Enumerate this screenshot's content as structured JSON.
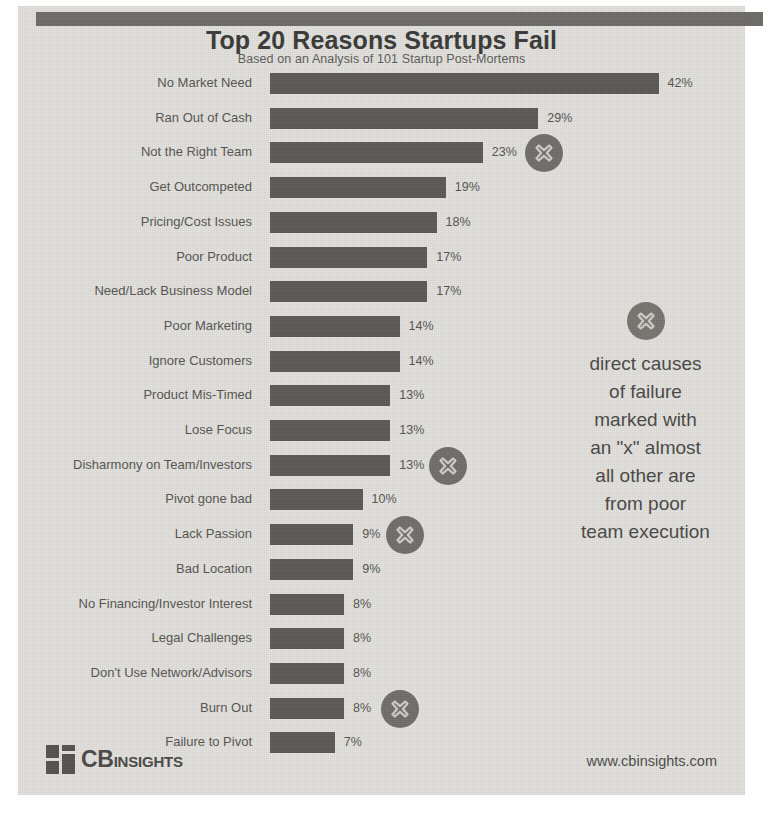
{
  "header": {
    "title": "Top 20 Reasons Startups Fail",
    "subtitle": "Based on an Analysis of 101 Startup Post-Mortems"
  },
  "annotation": {
    "icon": "x-circle-icon",
    "lines": [
      "direct causes",
      "of failure",
      "marked with",
      "an \"x\" almost",
      "all other are",
      "from poor",
      "team execution"
    ],
    "text": "direct causes of failure marked with an \"x\" almost all other are from poor team execution"
  },
  "footer": {
    "logo_primary": "CB",
    "logo_secondary": "INSIGHTS",
    "url": "www.cbinsights.com"
  },
  "colors": {
    "bar": "#5b5a57",
    "marker": "#706f6b",
    "paper": "#e3e2df",
    "topbar": "#6d6c69",
    "title_text": "#3a3a38",
    "label_text": "#56554f"
  },
  "chart_data": {
    "type": "bar",
    "orientation": "horizontal",
    "title": "Top 20 Reasons Startups Fail",
    "subtitle": "Based on an Analysis of 101 Startup Post-Mortems",
    "xlabel": "",
    "ylabel": "",
    "xlim": [
      0,
      45
    ],
    "grid": false,
    "legend": false,
    "value_suffix": "%",
    "categories": [
      "No Market Need",
      "Ran Out of Cash",
      "Not the Right Team",
      "Get Outcompeted",
      "Pricing/Cost Issues",
      "Poor Product",
      "Need/Lack Business Model",
      "Poor Marketing",
      "Ignore Customers",
      "Product Mis-Timed",
      "Lose Focus",
      "Disharmony on Team/Investors",
      "Pivot gone bad",
      "Lack Passion",
      "Bad Location",
      "No Financing/Investor Interest",
      "Legal Challenges",
      "Don't Use Network/Advisors",
      "Burn Out",
      "Failure to Pivot"
    ],
    "values": [
      42,
      29,
      23,
      19,
      18,
      17,
      17,
      14,
      14,
      13,
      13,
      13,
      10,
      9,
      9,
      8,
      8,
      8,
      8,
      7
    ],
    "value_labels": [
      "42%",
      "29%",
      "23%",
      "19%",
      "18%",
      "17%",
      "17%",
      "14%",
      "14%",
      "13%",
      "13%",
      "13%",
      "10%",
      "9%",
      "9%",
      "8%",
      "8%",
      "8%",
      "8%",
      "7%"
    ],
    "marked_direct_cause": [
      false,
      false,
      true,
      false,
      false,
      false,
      false,
      false,
      false,
      false,
      false,
      true,
      false,
      true,
      false,
      false,
      false,
      false,
      true,
      false
    ]
  }
}
